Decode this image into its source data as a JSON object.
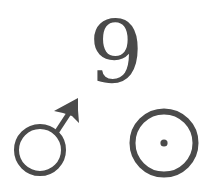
{
  "figure": {
    "number_label": "9",
    "symbols": [
      {
        "name": "mars-male-symbol",
        "icon": "mars-icon",
        "unicode": "♂"
      },
      {
        "name": "sun-circumpunct-symbol",
        "icon": "sun-icon",
        "unicode": "☉"
      }
    ],
    "colors": {
      "ink": "#4a4a4a",
      "background": "#ffffff"
    }
  }
}
